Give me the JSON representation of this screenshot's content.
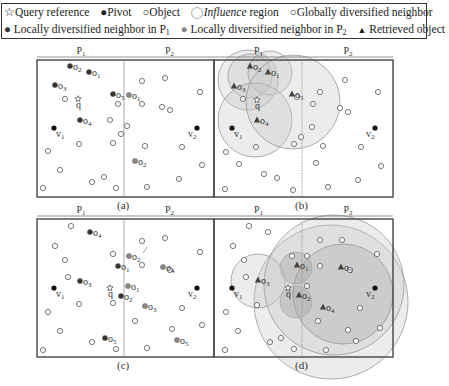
{
  "legend": {
    "row1": [
      {
        "symbol": "☆",
        "label": "Query reference"
      },
      {
        "symbol": "●",
        "label": "Pivot"
      },
      {
        "symbol": "○",
        "label": "Object"
      },
      {
        "symbol": "◯",
        "label_italic": "Influence",
        "label": " region"
      },
      {
        "symbol": "○",
        "label": "Globally diversified neighbor"
      }
    ],
    "row2": [
      {
        "symbol": "●",
        "label": "Locally diversified neighbor in P",
        "sub": "1"
      },
      {
        "symbol": "●",
        "label": "Locally diversified neighbor in P",
        "sub": "2"
      },
      {
        "symbol": "▲",
        "label": "Retrieved object"
      }
    ]
  },
  "colors": {
    "pivot": "#111111",
    "local_p1": "#333333",
    "local_p2": "#888888",
    "object_stroke": "#555555",
    "region_fill": "#cccccc",
    "frame": "#444444"
  },
  "panels": [
    {
      "id": "a",
      "caption": "(a)",
      "partitions": [
        "P1",
        "P2"
      ],
      "x0": 37,
      "y0": 60,
      "x1": 214,
      "y1": 197,
      "div": 124
    },
    {
      "id": "b",
      "caption": "(b)",
      "partitions": [
        "P1",
        "P2"
      ],
      "x0": 214,
      "y0": 60,
      "x1": 393,
      "y1": 197,
      "div": 302
    },
    {
      "id": "c",
      "caption": "(c)",
      "partitions": [
        "P1",
        "P2"
      ],
      "x0": 37,
      "y0": 219,
      "x1": 214,
      "y1": 357,
      "div": 124
    },
    {
      "id": "d",
      "caption": "(d)",
      "partitions": [
        "P1",
        "P2"
      ],
      "x0": 214,
      "y0": 219,
      "x1": 393,
      "y1": 357,
      "div": 302
    }
  ],
  "panel_a": {
    "query": {
      "x": 78,
      "y": 99,
      "label": "q"
    },
    "pivots": [
      {
        "x": 54,
        "y": 128,
        "label": "v1"
      },
      {
        "x": 197,
        "y": 128,
        "label": "v2"
      }
    ],
    "local_p1": [
      {
        "x": 70,
        "y": 66,
        "label": "o2"
      },
      {
        "x": 89,
        "y": 72,
        "label": "o1"
      },
      {
        "x": 55,
        "y": 85,
        "label": "o3"
      },
      {
        "x": 80,
        "y": 120,
        "label": "o4"
      },
      {
        "x": 113,
        "y": 94,
        "label": "o5"
      }
    ],
    "local_p2": [
      {
        "x": 129,
        "y": 95,
        "label": "o1"
      },
      {
        "x": 135,
        "y": 161,
        "label": "o2"
      }
    ],
    "objects": [
      [
        65,
        99
      ],
      [
        118,
        104
      ],
      [
        110,
        120
      ],
      [
        121,
        134
      ],
      [
        127,
        126
      ],
      [
        79,
        144
      ],
      [
        113,
        143
      ],
      [
        48,
        151
      ],
      [
        60,
        170
      ],
      [
        92,
        182
      ],
      [
        104,
        177
      ],
      [
        43,
        188
      ],
      [
        116,
        188
      ],
      [
        142,
        81
      ],
      [
        165,
        78
      ],
      [
        200,
        92
      ],
      [
        142,
        104
      ],
      [
        162,
        107
      ],
      [
        170,
        110
      ],
      [
        145,
        146
      ],
      [
        182,
        147
      ],
      [
        202,
        165
      ],
      [
        179,
        179
      ],
      [
        147,
        187
      ]
    ]
  },
  "panel_b": {
    "query": {
      "x": 257,
      "y": 100,
      "label": "q"
    },
    "pivots": [
      {
        "x": 232,
        "y": 128,
        "label": "v1"
      },
      {
        "x": 375,
        "y": 128,
        "label": "v2"
      }
    ],
    "retrieved": [
      {
        "x": 250,
        "y": 66,
        "label": "o2"
      },
      {
        "x": 268,
        "y": 72,
        "label": "o1"
      },
      {
        "x": 234,
        "y": 86,
        "label": "o3"
      },
      {
        "x": 257,
        "y": 120,
        "label": "o4"
      },
      {
        "x": 292,
        "y": 94,
        "label": "o5"
      }
    ],
    "regions": [
      {
        "cx": 248,
        "cy": 80,
        "r": 30
      },
      {
        "cx": 250,
        "cy": 76,
        "r": 22
      },
      {
        "cx": 270,
        "cy": 73,
        "r": 22
      },
      {
        "cx": 255,
        "cy": 120,
        "r": 37
      },
      {
        "cx": 293,
        "cy": 102,
        "r": 47
      }
    ],
    "objects": [
      [
        243,
        99
      ],
      [
        297,
        97
      ],
      [
        320,
        92
      ],
      [
        313,
        104
      ],
      [
        345,
        80
      ],
      [
        378,
        92
      ],
      [
        340,
        108
      ],
      [
        348,
        112
      ],
      [
        312,
        127
      ],
      [
        301,
        137
      ],
      [
        294,
        144
      ],
      [
        256,
        147
      ],
      [
        226,
        152
      ],
      [
        239,
        164
      ],
      [
        264,
        174
      ],
      [
        277,
        178
      ],
      [
        225,
        189
      ],
      [
        293,
        190
      ],
      [
        323,
        146
      ],
      [
        316,
        163
      ],
      [
        361,
        147
      ],
      [
        381,
        166
      ],
      [
        358,
        180
      ],
      [
        328,
        187
      ]
    ]
  },
  "panel_c": {
    "query": {
      "x": 110,
      "y": 288,
      "label": "q"
    },
    "pivots": [
      {
        "x": 54,
        "y": 288,
        "label": "v1"
      },
      {
        "x": 197,
        "y": 288,
        "label": "v2"
      }
    ],
    "local_p1": [
      {
        "x": 90,
        "y": 232,
        "label": "o4"
      },
      {
        "x": 118,
        "y": 266,
        "label": "o1"
      },
      {
        "x": 80,
        "y": 281,
        "label": "o3"
      },
      {
        "x": 121,
        "y": 296,
        "label": "o2"
      },
      {
        "x": 105,
        "y": 338,
        "label": "o5"
      }
    ],
    "local_p2": [
      {
        "x": 129,
        "y": 256,
        "label": "o2"
      },
      {
        "x": 128,
        "y": 286,
        "label": "o1"
      },
      {
        "x": 163,
        "y": 267,
        "label": "o4"
      },
      {
        "x": 145,
        "y": 306,
        "label": "o3"
      },
      {
        "x": 177,
        "y": 340,
        "label": "o5"
      }
    ],
    "objects": [
      [
        71,
        226
      ],
      [
        55,
        246
      ],
      [
        65,
        260
      ],
      [
        68,
        277
      ],
      [
        79,
        304
      ],
      [
        48,
        312
      ],
      [
        60,
        331
      ],
      [
        43,
        350
      ],
      [
        92,
        342
      ],
      [
        116,
        349
      ],
      [
        113,
        254
      ],
      [
        113,
        303
      ],
      [
        142,
        241
      ],
      [
        165,
        238
      ],
      [
        200,
        252
      ],
      [
        142,
        265
      ],
      [
        170,
        270
      ],
      [
        182,
        308
      ],
      [
        135,
        321
      ],
      [
        172,
        329
      ],
      [
        202,
        325
      ],
      [
        147,
        348
      ]
    ]
  },
  "panel_d": {
    "query": {
      "x": 288,
      "y": 288,
      "label": "q"
    },
    "pivots": [
      {
        "x": 232,
        "y": 288,
        "label": "v1"
      },
      {
        "x": 375,
        "y": 288,
        "label": "v2"
      }
    ],
    "retrieved": [
      {
        "x": 297,
        "y": 265,
        "label": "o1"
      },
      {
        "x": 258,
        "y": 280,
        "label": "o3"
      },
      {
        "x": 299,
        "y": 295,
        "label": "o2"
      },
      {
        "x": 323,
        "y": 307,
        "label": "o4"
      },
      {
        "x": 341,
        "y": 267,
        "label": "o5"
      }
    ],
    "regions": [
      {
        "cx": 331,
        "cy": 302,
        "r": 77,
        "shade": "light"
      },
      {
        "cx": 296,
        "cy": 268,
        "r": 16,
        "shade": "dark"
      },
      {
        "cx": 296,
        "cy": 302,
        "r": 16,
        "shade": "dark"
      },
      {
        "cx": 258,
        "cy": 281,
        "r": 27,
        "shade": "light"
      },
      {
        "cx": 334,
        "cy": 285,
        "r": 70,
        "shade": "light"
      },
      {
        "cx": 343,
        "cy": 294,
        "r": 50,
        "shade": "mid"
      }
    ],
    "objects": [
      [
        249,
        226
      ],
      [
        268,
        232
      ],
      [
        233,
        246
      ],
      [
        244,
        260
      ],
      [
        246,
        277
      ],
      [
        257,
        305
      ],
      [
        226,
        312
      ],
      [
        238,
        331
      ],
      [
        270,
        342
      ],
      [
        281,
        338
      ],
      [
        294,
        349
      ],
      [
        225,
        350
      ],
      [
        292,
        256
      ],
      [
        307,
        256
      ],
      [
        320,
        240
      ],
      [
        342,
        240
      ],
      [
        377,
        254
      ],
      [
        320,
        266
      ],
      [
        350,
        270
      ],
      [
        307,
        286
      ],
      [
        360,
        308
      ],
      [
        318,
        321
      ],
      [
        348,
        330
      ],
      [
        356,
        341
      ],
      [
        380,
        328
      ],
      [
        326,
        350
      ]
    ]
  }
}
